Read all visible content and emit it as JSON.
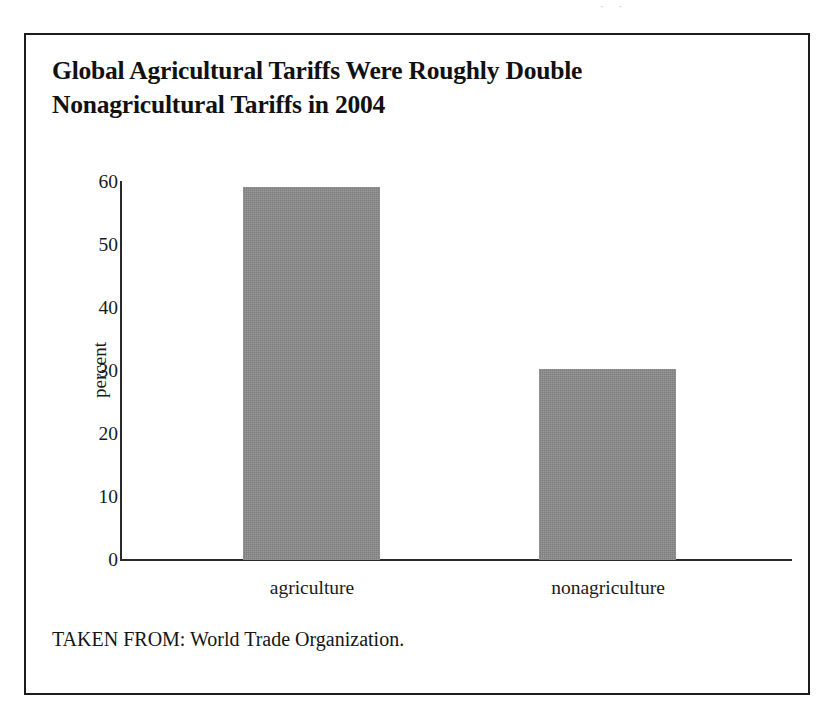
{
  "page": {
    "scan_artifact": "· ·"
  },
  "figure": {
    "title_line_1": "Global Agricultural Tariffs Were Roughly Double",
    "title_line_2": "Nonagricultural Tariffs in 2004",
    "source_note": "TAKEN FROM: World Trade Organization.",
    "frame_color": "#1c1c1c",
    "bar_color": "#8b8b8b",
    "axis_color": "#2a2a2a"
  },
  "chart_data": {
    "type": "bar",
    "title": "Global Agricultural Tariffs Were Roughly Double Nonagricultural Tariffs in 2004",
    "categories": [
      "agriculture",
      "nonagriculture"
    ],
    "values": [
      59,
      30.2
    ],
    "series": [
      {
        "name": "tariff rate",
        "values": [
          59,
          30.2
        ]
      }
    ],
    "xlabel": "",
    "ylabel": "percent",
    "ylim": [
      0,
      60
    ],
    "yticks": [
      0,
      10,
      20,
      30,
      40,
      50,
      60
    ],
    "ytick_labels": [
      "0",
      "10",
      "20",
      "30",
      "40",
      "50",
      "60"
    ],
    "grid": false,
    "legend": false,
    "source": "World Trade Organization"
  }
}
